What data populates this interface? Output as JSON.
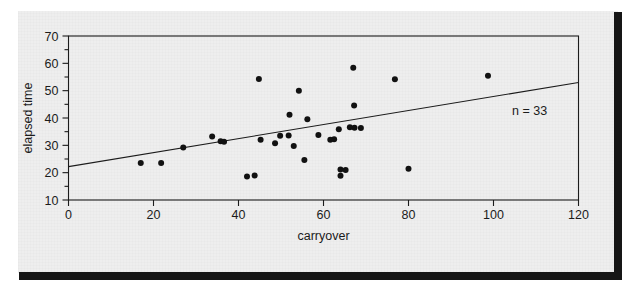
{
  "figure": {
    "background_color": "#eeeeee",
    "page_color": "#ffffff",
    "rule_color": "#161616",
    "ink_color": "#1b1b1b"
  },
  "chart_data": {
    "type": "scatter",
    "title": "",
    "subtitle": "",
    "xlabel": "carryover",
    "ylabel": "elapsed time",
    "xlim": [
      0,
      120
    ],
    "ylim": [
      10,
      70
    ],
    "grid": false,
    "legend": "none",
    "x_ticks": [
      0,
      20,
      40,
      60,
      80,
      100,
      120
    ],
    "x_tick_labels": [
      "0",
      "20",
      "40",
      "60",
      "80",
      "100",
      "120"
    ],
    "x_minor_ticks": [],
    "y_ticks": [
      10,
      20,
      30,
      40,
      50,
      60,
      70
    ],
    "y_tick_labels": [
      "10",
      "20",
      "30",
      "40",
      "50",
      "60",
      "70"
    ],
    "y_minor_ticks": [
      15,
      25,
      35,
      45,
      55,
      65
    ],
    "marker": {
      "shape": "circle",
      "color": "#111111",
      "radius_px": 3.0
    },
    "annotations": [
      {
        "text": "n = 33",
        "x": 108.5,
        "y": 41.0,
        "name": "sample-size-annotation"
      }
    ],
    "series": [
      {
        "name": "observations",
        "n": 33,
        "points": [
          [
            17.0,
            23.5
          ],
          [
            21.8,
            23.5
          ],
          [
            27.0,
            29.2
          ],
          [
            33.8,
            33.2
          ],
          [
            35.8,
            31.5
          ],
          [
            42.0,
            18.6
          ],
          [
            44.8,
            54.3
          ],
          [
            45.2,
            32.0
          ],
          [
            48.6,
            30.8
          ],
          [
            51.8,
            33.6
          ],
          [
            52.0,
            41.2
          ],
          [
            54.2,
            50.0
          ],
          [
            55.5,
            24.6
          ],
          [
            56.2,
            39.5
          ],
          [
            62.5,
            32.2
          ],
          [
            63.6,
            35.9
          ],
          [
            64.0,
            21.2
          ],
          [
            64.0,
            18.9
          ],
          [
            67.0,
            58.4
          ],
          [
            67.2,
            44.6
          ],
          [
            67.3,
            36.4
          ],
          [
            68.8,
            36.3
          ],
          [
            76.8,
            54.2
          ],
          [
            80.0,
            21.4
          ],
          [
            98.7,
            55.5
          ],
          [
            53.0,
            29.8
          ],
          [
            58.8,
            33.8
          ],
          [
            49.8,
            33.5
          ],
          [
            66.2,
            36.6
          ],
          [
            36.6,
            31.3
          ],
          [
            43.8,
            19.0
          ],
          [
            61.6,
            32.0
          ],
          [
            65.2,
            21.0
          ]
        ]
      }
    ],
    "fit_line": {
      "name": "least-squares-line",
      "color": "#1b1b1b",
      "width_px": 1.1,
      "x_start": 0,
      "y_start": 22.2,
      "x_end": 120,
      "y_end": 53.0,
      "slope": 0.2567,
      "intercept": 22.2
    }
  }
}
